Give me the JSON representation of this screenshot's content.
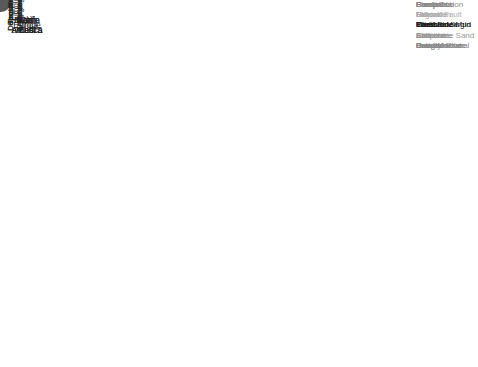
{
  "chart_data": {
    "type": "bubble-small-multiples",
    "title": "",
    "columns": [
      "North\nAmerica",
      "Latin\nAmerica",
      "Europe",
      "Africa",
      "Middle\nEast",
      "Russia\nand CIS",
      "Far\nEast"
    ],
    "rows": [
      {
        "label": "Tectonic\nRegime",
        "legend": [
          "Compression",
          "Extension",
          "Inversion",
          "Evaporite",
          "Gravity"
        ]
      },
      {
        "label": "Depositional\nSystem",
        "legend": [
          "Coastal",
          "Fluvial",
          "Carbonate Mud",
          "Carbonate Sand",
          "Deep Marine"
        ]
      },
      {
        "label": "Depositional\nEnvironment",
        "legend": [
          "Ramp",
          "Lagoon",
          "Shelf",
          "Shoreface",
          "Braided River"
        ]
      },
      {
        "label": "Lithology",
        "legend": [
          "Sandstone",
          "Dolomite",
          "Limestone",
          "Siltstone",
          "Conglomerate"
        ]
      },
      {
        "label": "Structural\nSettings",
        "legend": [
          "Foreland",
          "Rift",
          "Passive Margin",
          "Salt",
          "Inversion"
        ]
      },
      {
        "label": "Trapping\nMechanism",
        "legend": [
          "Pinch-Out",
          "Normal Fault",
          "Tilted Block",
          "Anticline",
          "Paleostructural"
        ]
      }
    ],
    "grid": true,
    "bubble_color": "#5a5a5a",
    "gridline_color": "#dcdcdc",
    "bubbles": [
      [
        0,
        0,
        0.18,
        0.22,
        12
      ],
      [
        0,
        0,
        0.62,
        0.3,
        5
      ],
      [
        0,
        0,
        0.45,
        0.85,
        4
      ],
      [
        0,
        0,
        0.82,
        0.85,
        4
      ],
      [
        0,
        0,
        0.8,
        0.55,
        1
      ],
      [
        0,
        1,
        0.28,
        0.34,
        4
      ],
      [
        0,
        1,
        0.65,
        0.25,
        4
      ],
      [
        0,
        1,
        0.9,
        0.18,
        1.5
      ],
      [
        0,
        1,
        0.25,
        0.68,
        1.5
      ],
      [
        0,
        1,
        0.82,
        0.85,
        1
      ],
      [
        0,
        2,
        0.22,
        0.25,
        4
      ],
      [
        0,
        2,
        0.72,
        0.6,
        8
      ],
      [
        0,
        2,
        0.1,
        0.55,
        1.5
      ],
      [
        0,
        2,
        0.3,
        0.72,
        3
      ],
      [
        0,
        2,
        0.55,
        0.9,
        3
      ],
      [
        0,
        3,
        0.3,
        0.08,
        1
      ],
      [
        0,
        3,
        0.4,
        0.42,
        2
      ],
      [
        0,
        3,
        0.65,
        0.42,
        1
      ],
      [
        0,
        3,
        0.25,
        0.7,
        4
      ],
      [
        0,
        3,
        0.9,
        0.88,
        1
      ],
      [
        0,
        4,
        0.12,
        0.35,
        6
      ],
      [
        0,
        4,
        0.4,
        0.18,
        1.5
      ],
      [
        0,
        4,
        0.55,
        0.82,
        6
      ],
      [
        0,
        4,
        0.92,
        0.18,
        2
      ],
      [
        0,
        5,
        0.48,
        0.2,
        4
      ],
      [
        0,
        5,
        0.48,
        0.56,
        2
      ],
      [
        0,
        5,
        0.88,
        0.7,
        1
      ],
      [
        0,
        6,
        0.28,
        0.35,
        4
      ],
      [
        0,
        6,
        0.82,
        0.25,
        1
      ],
      [
        0,
        6,
        0.22,
        0.85,
        5
      ],
      [
        0,
        6,
        0.78,
        0.8,
        6.5
      ],
      [
        1,
        0,
        0.3,
        0.2,
        3
      ],
      [
        1,
        0,
        0.7,
        0.42,
        6
      ],
      [
        1,
        0,
        0.2,
        0.72,
        3
      ],
      [
        1,
        0,
        0.65,
        0.9,
        4
      ],
      [
        1,
        0,
        0.4,
        0.96,
        2
      ],
      [
        1,
        1,
        0.38,
        0.2,
        2
      ],
      [
        1,
        1,
        0.3,
        0.55,
        1
      ],
      [
        1,
        1,
        0.95,
        0.62,
        2
      ],
      [
        1,
        1,
        0.45,
        0.88,
        1
      ],
      [
        1,
        1,
        0.8,
        0.85,
        1
      ],
      [
        1,
        2,
        0.2,
        0.48,
        2
      ],
      [
        1,
        2,
        0.65,
        0.3,
        4
      ],
      [
        1,
        2,
        0.42,
        0.8,
        2
      ],
      [
        1,
        2,
        0.1,
        0.85,
        1
      ],
      [
        1,
        2,
        0.95,
        0.08,
        1
      ],
      [
        1,
        3,
        0.35,
        0.12,
        1
      ],
      [
        1,
        3,
        0.85,
        0.35,
        1
      ],
      [
        1,
        3,
        0.65,
        0.72,
        1.5
      ],
      [
        1,
        3,
        0.3,
        0.9,
        1
      ],
      [
        1,
        4,
        0.35,
        0.3,
        3
      ],
      [
        1,
        4,
        0.65,
        0.46,
        3
      ],
      [
        1,
        4,
        0.92,
        0.88,
        1
      ],
      [
        1,
        5,
        0.3,
        0.52,
        3
      ],
      [
        1,
        5,
        0.55,
        0.18,
        1
      ],
      [
        1,
        5,
        0.8,
        0.7,
        1
      ],
      [
        1,
        6,
        0.4,
        0.2,
        6
      ],
      [
        1,
        6,
        0.2,
        0.72,
        4
      ],
      [
        1,
        6,
        0.8,
        0.88,
        1
      ],
      [
        1,
        6,
        0.9,
        0.42,
        1
      ],
      [
        2,
        0,
        0.25,
        0.2,
        1.5
      ],
      [
        2,
        0,
        0.55,
        0.3,
        2.5
      ],
      [
        2,
        0,
        0.22,
        0.7,
        2
      ],
      [
        2,
        0,
        0.45,
        0.9,
        3
      ],
      [
        2,
        0,
        0.85,
        0.35,
        1
      ],
      [
        2,
        1,
        0.35,
        0.35,
        1.5
      ],
      [
        2,
        1,
        0.8,
        0.65,
        1
      ],
      [
        2,
        1,
        0.4,
        0.9,
        1
      ],
      [
        2,
        2,
        0.45,
        0.38,
        1
      ],
      [
        2,
        2,
        0.7,
        0.45,
        1.5
      ],
      [
        2,
        2,
        0.85,
        0.75,
        1
      ],
      [
        2,
        3,
        0.3,
        0.12,
        1
      ],
      [
        2,
        3,
        0.25,
        0.5,
        4
      ],
      [
        2,
        3,
        0.7,
        0.78,
        1.5
      ],
      [
        2,
        4,
        0.12,
        0.68,
        1.5
      ],
      [
        2,
        4,
        0.4,
        0.3,
        1
      ],
      [
        2,
        5,
        0.35,
        0.5,
        1
      ],
      [
        2,
        5,
        0.6,
        0.25,
        1
      ],
      [
        2,
        5,
        0.78,
        0.88,
        1
      ],
      [
        2,
        6,
        0.22,
        0.45,
        1
      ],
      [
        2,
        6,
        0.85,
        0.1,
        1
      ],
      [
        2,
        6,
        0.95,
        0.8,
        1.5
      ],
      [
        3,
        0,
        0.25,
        0.4,
        7
      ],
      [
        3,
        0,
        0.05,
        0.68,
        3
      ],
      [
        3,
        0,
        0.7,
        0.8,
        1
      ],
      [
        3,
        0,
        0.48,
        0.95,
        2
      ],
      [
        3,
        1,
        0.35,
        0.45,
        4
      ],
      [
        3,
        1,
        0.78,
        0.55,
        2
      ],
      [
        3,
        1,
        0.4,
        0.88,
        1
      ],
      [
        3,
        2,
        0.7,
        0.52,
        7
      ],
      [
        3,
        2,
        0.45,
        0.12,
        1
      ],
      [
        3,
        2,
        0.35,
        0.72,
        1
      ],
      [
        3,
        2,
        0.62,
        0.92,
        1
      ],
      [
        3,
        3,
        0.12,
        0.5,
        1
      ],
      [
        3,
        3,
        0.45,
        0.75,
        1
      ],
      [
        3,
        4,
        0.62,
        0.38,
        1
      ],
      [
        3,
        4,
        0.38,
        0.55,
        1
      ],
      [
        3,
        4,
        0.8,
        0.9,
        1
      ],
      [
        3,
        5,
        0.45,
        0.28,
        3
      ],
      [
        3,
        5,
        0.2,
        0.6,
        1.5
      ],
      [
        3,
        5,
        0.75,
        0.55,
        1
      ],
      [
        3,
        6,
        0.28,
        0.55,
        1.5
      ],
      [
        3,
        6,
        0.55,
        0.35,
        1
      ],
      [
        3,
        6,
        0.45,
        0.82,
        6
      ],
      [
        4,
        0,
        0.4,
        0.2,
        8
      ],
      [
        4,
        0,
        0.12,
        0.55,
        3
      ],
      [
        4,
        0,
        0.35,
        0.62,
        4
      ],
      [
        4,
        0,
        0.82,
        0.82,
        1
      ],
      [
        4,
        1,
        0.55,
        0.1,
        1.5
      ],
      [
        4,
        1,
        0.6,
        0.4,
        4
      ],
      [
        4,
        1,
        0.25,
        0.86,
        2
      ],
      [
        4,
        1,
        0.82,
        0.86,
        1
      ],
      [
        4,
        2,
        0.3,
        0.3,
        9
      ],
      [
        4,
        2,
        0.9,
        0.4,
        1
      ],
      [
        4,
        2,
        0.5,
        0.85,
        4
      ],
      [
        4,
        2,
        0.85,
        0.72,
        2
      ],
      [
        4,
        3,
        0.12,
        0.3,
        1
      ],
      [
        4,
        3,
        0.4,
        0.55,
        1
      ],
      [
        4,
        3,
        0.55,
        0.72,
        1
      ],
      [
        4,
        4,
        0.2,
        0.58,
        4
      ],
      [
        4,
        4,
        0.2,
        0.8,
        2
      ],
      [
        4,
        4,
        0.85,
        0.9,
        1
      ],
      [
        4,
        5,
        0.4,
        0.35,
        1.5
      ],
      [
        4,
        5,
        0.65,
        0.6,
        1.5
      ],
      [
        4,
        5,
        0.3,
        0.1,
        1
      ],
      [
        4,
        6,
        0.95,
        0.1,
        2
      ],
      [
        4,
        6,
        0.2,
        0.55,
        4.5
      ],
      [
        4,
        6,
        0.7,
        0.58,
        4
      ],
      [
        4,
        6,
        0.55,
        0.95,
        1
      ],
      [
        5,
        0,
        0.6,
        0.2,
        4.5
      ],
      [
        5,
        0,
        0.12,
        0.62,
        1
      ],
      [
        5,
        0,
        0.25,
        0.9,
        2
      ],
      [
        5,
        0,
        0.8,
        0.85,
        1
      ],
      [
        5,
        1,
        0.2,
        0.28,
        2.5
      ],
      [
        5,
        1,
        0.5,
        0.6,
        1.5
      ],
      [
        5,
        1,
        0.75,
        0.75,
        1
      ],
      [
        5,
        2,
        0.18,
        0.22,
        2
      ],
      [
        5,
        2,
        0.6,
        0.45,
        4
      ],
      [
        5,
        2,
        0.85,
        0.6,
        3.5
      ],
      [
        5,
        2,
        0.4,
        0.75,
        1
      ],
      [
        5,
        2,
        0.3,
        0.92,
        2
      ],
      [
        5,
        3,
        0.25,
        0.15,
        1
      ],
      [
        5,
        3,
        0.18,
        0.5,
        1
      ],
      [
        5,
        3,
        0.85,
        0.72,
        2
      ],
      [
        5,
        4,
        0.2,
        0.72,
        1.5
      ],
      [
        5,
        4,
        0.55,
        0.3,
        1.5
      ],
      [
        5,
        4,
        0.7,
        0.82,
        1.5
      ],
      [
        5,
        4,
        0.55,
        0.92,
        1
      ],
      [
        5,
        5,
        0.2,
        0.38,
        1
      ],
      [
        5,
        5,
        0.85,
        0.55,
        1
      ],
      [
        5,
        5,
        0.25,
        0.8,
        2
      ],
      [
        5,
        6,
        0.35,
        0.22,
        2
      ],
      [
        5,
        6,
        0.8,
        0.18,
        2.5
      ],
      [
        5,
        6,
        0.2,
        0.48,
        1
      ],
      [
        5,
        6,
        0.35,
        0.9,
        2
      ]
    ],
    "bubble_fields": [
      "row",
      "col",
      "rel_x",
      "rel_y",
      "radius_px"
    ],
    "xlabel": "",
    "ylabel": "",
    "legend_position": "right"
  }
}
